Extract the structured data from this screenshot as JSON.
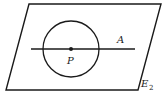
{
  "diagram": {
    "plane_label": "E",
    "plane_label_subscript": "2",
    "line_label": "A",
    "point_label": "P",
    "colors": {
      "stroke": "#1a1a1a",
      "background": "#ffffff"
    }
  }
}
